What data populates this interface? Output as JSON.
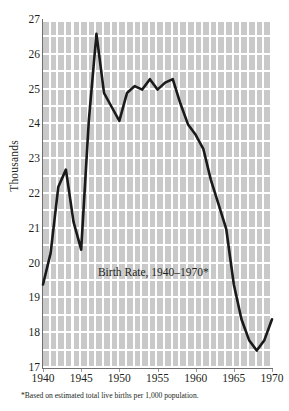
{
  "chart_data": {
    "type": "line",
    "title": "Birth Rate, 1940–1970*",
    "xlabel": "",
    "ylabel": "Thousands",
    "footnote": "*Based on estimated total live births per 1,000 population.",
    "xlim": [
      1940,
      1970
    ],
    "ylim": [
      17,
      27
    ],
    "grid": true,
    "legend": "none",
    "xticklabels": [
      "1940",
      "1945",
      "1950",
      "1955",
      "1960",
      "1965",
      "1970"
    ],
    "xtickvalues": [
      1940,
      1945,
      1950,
      1955,
      1960,
      1965,
      1970
    ],
    "yticklabels": [
      "17",
      "18",
      "19",
      "20",
      "21",
      "22",
      "23",
      "24",
      "25",
      "26",
      "27"
    ],
    "ytickvalues": [
      17,
      18,
      19,
      20,
      21,
      22,
      23,
      24,
      25,
      26,
      27
    ],
    "x": [
      1940,
      1941,
      1942,
      1943,
      1944,
      1945,
      1946,
      1947,
      1948,
      1949,
      1950,
      1951,
      1952,
      1953,
      1954,
      1955,
      1956,
      1957,
      1958,
      1959,
      1960,
      1961,
      1962,
      1963,
      1964,
      1965,
      1966,
      1967,
      1968,
      1969,
      1970
    ],
    "values": [
      19.4,
      20.3,
      22.2,
      22.7,
      21.2,
      20.4,
      24.1,
      26.6,
      24.9,
      24.5,
      24.1,
      24.9,
      25.1,
      25.0,
      25.3,
      25.0,
      25.2,
      25.3,
      24.6,
      24.0,
      23.7,
      23.3,
      22.4,
      21.7,
      21.0,
      19.4,
      18.4,
      17.8,
      17.5,
      17.8,
      18.4
    ],
    "series": [
      {
        "name": "Birth Rate",
        "color": "#1a1a1a",
        "values": [
          19.4,
          20.3,
          22.2,
          22.7,
          21.2,
          20.4,
          24.1,
          26.6,
          24.9,
          24.5,
          24.1,
          24.9,
          25.1,
          25.0,
          25.3,
          25.0,
          25.2,
          25.3,
          24.6,
          24.0,
          23.7,
          23.3,
          22.4,
          21.7,
          21.0,
          19.4,
          18.4,
          17.8,
          17.5,
          17.8,
          18.4
        ]
      }
    ],
    "colors": {
      "line": "#1a1a1a",
      "grid_fill": "#c9c9c9",
      "grid_rule": "#ffffff",
      "axis": "#6f6f6f",
      "text": "#231f20",
      "background": "#ffffff"
    }
  }
}
